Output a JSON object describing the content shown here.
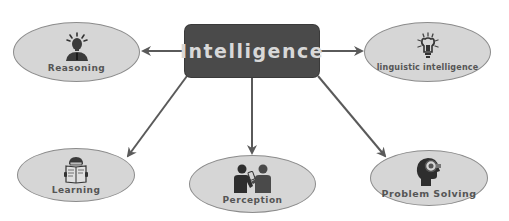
{
  "diagram": {
    "type": "mind-map",
    "center": {
      "label": "Intelligence",
      "fill": "#4a4a4a",
      "text_color": "#d8d8d8"
    },
    "node_fill": "#d6d6d6",
    "arrow_color": "#5a5a5a",
    "nodes": [
      {
        "id": "reasoning",
        "label": "Reasoning",
        "icon": "idea-person-icon",
        "position": "top-left"
      },
      {
        "id": "linguistic",
        "label": "linguistic intelligence",
        "icon": "lightbulb-icon",
        "position": "top-right"
      },
      {
        "id": "learning",
        "label": "Learning",
        "icon": "reading-person-icon",
        "position": "bottom-left"
      },
      {
        "id": "perception",
        "label": "Perception",
        "icon": "two-people-talking-icon",
        "position": "bottom-center"
      },
      {
        "id": "problem",
        "label": "Problem Solving",
        "icon": "head-gear-icon",
        "position": "bottom-right"
      }
    ],
    "edges": [
      {
        "from": "Intelligence",
        "to": "Reasoning"
      },
      {
        "from": "Intelligence",
        "to": "linguistic intelligence"
      },
      {
        "from": "Intelligence",
        "to": "Learning"
      },
      {
        "from": "Intelligence",
        "to": "Perception"
      },
      {
        "from": "Intelligence",
        "to": "Problem Solving"
      }
    ]
  }
}
